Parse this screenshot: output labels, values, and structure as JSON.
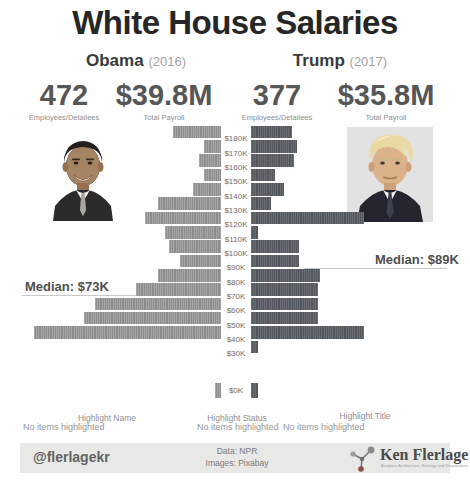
{
  "title": "White House Salaries",
  "panels": [
    {
      "name": "Obama",
      "year": "(2016)",
      "employees": "472",
      "employees_label": "Employees/Detailees",
      "payroll": "$39.8M",
      "payroll_label": "Total Payroll"
    },
    {
      "name": "Trump",
      "year": "(2017)",
      "employees": "377",
      "employees_label": "Employees/Detailees",
      "payroll": "$35.8M",
      "payroll_label": "Total Payroll"
    }
  ],
  "chart_data": {
    "type": "bar",
    "subtype": "back-to-back horizontal salary histogram (population-pyramid style), unit-striped bars, one row per $10K salary band",
    "bands": [
      "$180K",
      "$170K",
      "$160K",
      "$150K",
      "$140K",
      "$130K",
      "$120K",
      "$110K",
      "$100K",
      "$90K",
      "$80K",
      "$70K",
      "$60K",
      "$50K",
      "$40K",
      "$30K"
    ],
    "zero_band_label": "$0K",
    "series": [
      {
        "name": "Obama (2016)",
        "side": "left",
        "color": "#979797",
        "values": [
          22,
          8,
          10,
          8,
          13,
          29,
          35,
          26,
          24,
          19,
          29,
          39,
          58,
          63,
          86,
          0
        ],
        "zero_band_value": 3,
        "total": 472,
        "median": "Median: $73K"
      },
      {
        "name": "Trump (2017)",
        "side": "right",
        "color": "#575b62",
        "values": [
          19,
          21,
          20,
          11,
          15,
          9,
          52,
          3,
          22,
          22,
          32,
          31,
          31,
          31,
          52,
          3
        ],
        "zero_band_value": 3,
        "total": 377,
        "median": "Median: $89K"
      }
    ],
    "axis_note": "center axis labels $180K (top) to $30K (bottom), detached $0K row below; bar length = number of employees"
  },
  "highlighters": [
    {
      "label": "Highlight Name",
      "status": "No items highlighted"
    },
    {
      "label": "Highlight Status",
      "status": "No items highlighted"
    },
    {
      "label": "Highlight Title",
      "status": "No items highlighted"
    }
  ],
  "footer": {
    "handle": "@flerlagekr",
    "credit_line1": "Data: NPR",
    "credit_line2": "Images: Pixabay",
    "brand": "Ken Flerlage",
    "brand_tagline": "Analytics Architecture, Strategy and Visualization"
  }
}
